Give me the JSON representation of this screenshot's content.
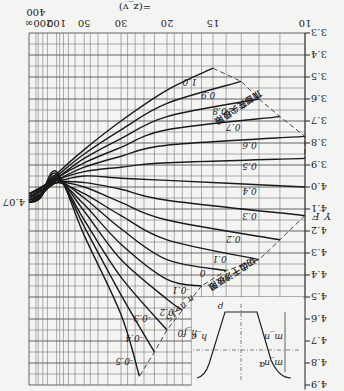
{
  "chart_data": {
    "type": "line",
    "orientation_note_visible": "image shown rotated 180 degrees",
    "title": "",
    "xlabel": "z_v (z_v=z/cos^3 β)",
    "ylabel": "Y_F",
    "x_scale": "reciprocal",
    "x_ticks": [
      "10",
      "15",
      "20",
      "30",
      "50",
      "100",
      "200",
      "400",
      "∞"
    ],
    "y_ticks": [
      "3.3",
      "3.4",
      "3.5",
      "3.6",
      "3.7",
      "3.8",
      "3.9",
      "4.0",
      "4.1",
      "4.2",
      "4.3",
      "4.4",
      "4.5",
      "4.6",
      "4.7",
      "4.8",
      "4.9"
    ],
    "ylim": [
      3.3,
      4.9
    ],
    "grid": true,
    "parameter_name": "x (modification coefficient)",
    "series": [
      {
        "name": "1.0",
        "x": [
          "15",
          "20",
          "30",
          "50",
          "100",
          "∞"
        ],
        "values": [
          3.46,
          3.56,
          3.7,
          3.83,
          3.94,
          4.03
        ]
      },
      {
        "name": "0.9",
        "x": [
          "13",
          "20",
          "30",
          "50",
          "100",
          "∞"
        ],
        "values": [
          3.52,
          3.62,
          3.74,
          3.85,
          3.95,
          4.03
        ]
      },
      {
        "name": "0.8",
        "x": [
          "12",
          "20",
          "30",
          "50",
          "100",
          "∞"
        ],
        "values": [
          3.6,
          3.68,
          3.78,
          3.87,
          3.96,
          4.03
        ]
      },
      {
        "name": "0.7",
        "x": [
          "11",
          "20",
          "30",
          "50",
          "100",
          "∞"
        ],
        "values": [
          3.68,
          3.74,
          3.82,
          3.89,
          3.96,
          4.04
        ]
      },
      {
        "name": "0.6",
        "x": [
          "10",
          "20",
          "30",
          "50",
          "100",
          "∞"
        ],
        "values": [
          3.77,
          3.81,
          3.86,
          3.91,
          3.97,
          4.04
        ]
      },
      {
        "name": "0.5",
        "x": [
          "10",
          "20",
          "30",
          "50",
          "100",
          "∞"
        ],
        "values": [
          3.87,
          3.89,
          3.91,
          3.93,
          3.97,
          4.05
        ]
      },
      {
        "name": "0.4",
        "x": [
          "10",
          "20",
          "30",
          "50",
          "100",
          "∞"
        ],
        "values": [
          4.0,
          3.97,
          3.96,
          3.95,
          3.98,
          4.05
        ]
      },
      {
        "name": "0.3",
        "x": [
          "10",
          "20",
          "30",
          "50",
          "100",
          "∞"
        ],
        "values": [
          4.13,
          4.06,
          4.01,
          3.98,
          3.98,
          4.06
        ]
      },
      {
        "name": "0.2",
        "x": [
          "11",
          "20",
          "30",
          "50",
          "100",
          "∞"
        ],
        "values": [
          4.24,
          4.15,
          4.07,
          4.0,
          3.98,
          4.06
        ]
      },
      {
        "name": "0.1",
        "x": [
          "12",
          "20",
          "30",
          "50",
          "100",
          "∞"
        ],
        "values": [
          4.33,
          4.24,
          4.13,
          4.03,
          3.98,
          4.06
        ]
      },
      {
        "name": "0",
        "x": [
          "14",
          "20",
          "30",
          "50",
          "100",
          "∞"
        ],
        "values": [
          4.38,
          4.33,
          4.19,
          4.05,
          3.97,
          4.06
        ]
      },
      {
        "name": "-0.1",
        "x": [
          "16",
          "20",
          "30",
          "50",
          "100",
          "∞"
        ],
        "values": [
          4.45,
          4.42,
          4.26,
          4.08,
          3.97,
          4.07
        ]
      },
      {
        "name": "-0.2",
        "x": [
          "18",
          "20",
          "30",
          "50",
          "100",
          "∞"
        ],
        "values": [
          4.56,
          4.51,
          4.33,
          4.11,
          3.96,
          4.07
        ]
      },
      {
        "name": "-0.3",
        "x": [
          "20",
          "30",
          "50",
          "100",
          "∞"
        ],
        "values": [
          4.65,
          4.41,
          4.15,
          3.95,
          4.07
        ]
      },
      {
        "name": "-0.4",
        "x": [
          "22",
          "30",
          "50",
          "100",
          "∞"
        ],
        "values": [
          4.75,
          4.49,
          4.18,
          3.94,
          4.07
        ]
      },
      {
        "name": "-0.5",
        "x": [
          "25",
          "30",
          "50",
          "100",
          "∞"
        ],
        "values": [
          4.86,
          4.58,
          4.22,
          3.93,
          4.07
        ]
      }
    ],
    "annotations": [
      "顶部变尖极限",
      "切齿干涉极限",
      "h_a>15",
      "4.07"
    ],
    "inset": {
      "labels": [
        "ρ_f",
        "α_a",
        "h_a",
        "h_f0",
        "m_n",
        "m_n",
        "ρ_f0"
      ]
    }
  },
  "labels": {
    "x_axis_label": "=(z_v)",
    "y_axis_label": "Y_F",
    "infinity_value": "4.07",
    "tip_limit": "顶部变尖极限",
    "undercut_limit": "切齿干涉极限",
    "ha_note": "h_a>15",
    "inset_rho": "ρ",
    "inset_alpha": "α",
    "inset_ha": "h_a",
    "inset_hf": "h_f0",
    "inset_mn1": "m_n",
    "inset_mn2": "m_n"
  }
}
